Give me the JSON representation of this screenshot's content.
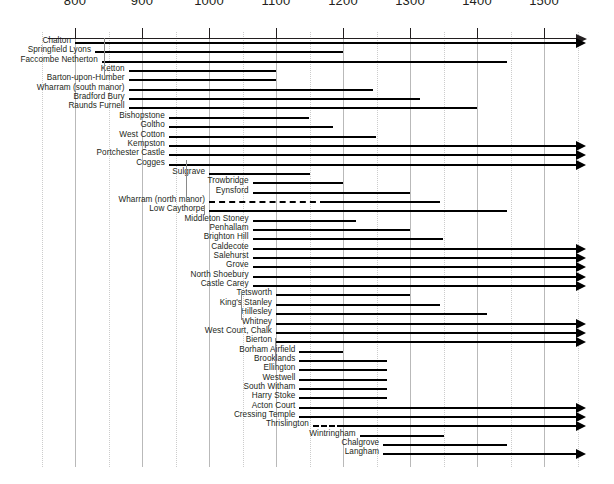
{
  "chart_data": {
    "type": "bar",
    "subtype": "horizontal-range-timeline",
    "title": "",
    "xlabel": "",
    "ylabel": "",
    "xlim": [
      760,
      1560
    ],
    "grid": true,
    "legend": null,
    "x_ticks": [
      800,
      900,
      1000,
      1100,
      1200,
      1300,
      1400,
      1500
    ],
    "x_tick_labels": [
      "800",
      "900",
      "1000",
      "1100",
      "1200",
      "1300",
      "1400",
      "1500"
    ],
    "axis_open_ended": true,
    "note": "Each row is a site; bar spans occupation date range. Arrow head = continues beyond 1500. Dashed segment = uncertain / inferred occupation.",
    "categories": [
      "Chalton",
      "Springfield Lyons",
      "Faccombe Netherton",
      "Ketton",
      "Barton-upon-Humber",
      "Wharram (south manor)",
      "Bradford Bury",
      "Raunds Furnell",
      "Bishopstone",
      "Goltho",
      "West Cotton",
      "Kempston",
      "Portchester Castle",
      "Cogges",
      "Sulgrave",
      "Trowbridge",
      "Eynsford",
      "Wharram (north manor)",
      "Low Caythorpe",
      "Middleton Stoney",
      "Penhallam",
      "Brighton Hill",
      "Caldecote",
      "Salehurst",
      "Grove",
      "North Shoebury",
      "Castle Carey",
      "Tetsworth",
      "King's Stanley",
      "Hillesley",
      "Whitney",
      "West Court, Chalk",
      "Bierton",
      "Borham Airfield",
      "Brooklands",
      "Ellington",
      "Westwell",
      "South Witham",
      "Harry Stoke",
      "Acton Court",
      "Cressing Temple",
      "Thrislington",
      "Wintringham",
      "Chalgrove",
      "Langham"
    ],
    "bars": [
      {
        "label": "Chalton",
        "start": 800,
        "end": 1500,
        "open_end": true,
        "dashed_start": null,
        "dashed_end": null
      },
      {
        "label": "Springfield Lyons",
        "start": 830,
        "end": 1200,
        "open_end": false,
        "dashed_start": null,
        "dashed_end": null
      },
      {
        "label": "Faccombe Netherton",
        "start": 840,
        "end": 1445,
        "open_end": false,
        "dashed_start": null,
        "dashed_end": null
      },
      {
        "label": "Ketton",
        "start": 880,
        "end": 1100,
        "open_end": false,
        "dashed_start": null,
        "dashed_end": null
      },
      {
        "label": "Barton-upon-Humber",
        "start": 880,
        "end": 1100,
        "open_end": false,
        "dashed_start": null,
        "dashed_end": null
      },
      {
        "label": "Wharram (south manor)",
        "start": 880,
        "end": 1245,
        "open_end": false,
        "dashed_start": null,
        "dashed_end": null
      },
      {
        "label": "Bradford Bury",
        "start": 880,
        "end": 1315,
        "open_end": false,
        "dashed_start": null,
        "dashed_end": null
      },
      {
        "label": "Raunds Furnell",
        "start": 880,
        "end": 1400,
        "open_end": false,
        "dashed_start": null,
        "dashed_end": null
      },
      {
        "label": "Bishopstone",
        "start": 940,
        "end": 1150,
        "open_end": false,
        "dashed_start": null,
        "dashed_end": null
      },
      {
        "label": "Goltho",
        "start": 940,
        "end": 1185,
        "open_end": false,
        "dashed_start": null,
        "dashed_end": null
      },
      {
        "label": "West Cotton",
        "start": 940,
        "end": 1250,
        "open_end": false,
        "dashed_start": null,
        "dashed_end": null
      },
      {
        "label": "Kempston",
        "start": 940,
        "end": 1500,
        "open_end": true,
        "dashed_start": null,
        "dashed_end": null
      },
      {
        "label": "Portchester Castle",
        "start": 940,
        "end": 1500,
        "open_end": true,
        "dashed_start": null,
        "dashed_end": null
      },
      {
        "label": "Cogges",
        "start": 940,
        "end": 1500,
        "open_end": true,
        "dashed_start": null,
        "dashed_end": null
      },
      {
        "label": "Sulgrave",
        "start": 1000,
        "end": 1150,
        "open_end": false,
        "dashed_start": null,
        "dashed_end": null
      },
      {
        "label": "Trowbridge",
        "start": 1065,
        "end": 1200,
        "open_end": false,
        "dashed_start": null,
        "dashed_end": null
      },
      {
        "label": "Eynsford",
        "start": 1065,
        "end": 1300,
        "open_end": false,
        "dashed_start": null,
        "dashed_end": null
      },
      {
        "label": "Wharram (north manor)",
        "start": 1000,
        "end": 1345,
        "open_end": false,
        "dashed_start": 1000,
        "dashed_end": 1175
      },
      {
        "label": "Low Caythorpe",
        "start": 1000,
        "end": 1445,
        "open_end": false,
        "dashed_start": null,
        "dashed_end": null
      },
      {
        "label": "Middleton Stoney",
        "start": 1065,
        "end": 1220,
        "open_end": false,
        "dashed_start": null,
        "dashed_end": null
      },
      {
        "label": "Penhallam",
        "start": 1065,
        "end": 1300,
        "open_end": false,
        "dashed_start": null,
        "dashed_end": null
      },
      {
        "label": "Brighton Hill",
        "start": 1065,
        "end": 1350,
        "open_end": false,
        "dashed_start": null,
        "dashed_end": null
      },
      {
        "label": "Caldecote",
        "start": 1065,
        "end": 1500,
        "open_end": true,
        "dashed_start": null,
        "dashed_end": null
      },
      {
        "label": "Salehurst",
        "start": 1065,
        "end": 1500,
        "open_end": true,
        "dashed_start": null,
        "dashed_end": null
      },
      {
        "label": "Grove",
        "start": 1065,
        "end": 1500,
        "open_end": true,
        "dashed_start": null,
        "dashed_end": null
      },
      {
        "label": "North Shoebury",
        "start": 1065,
        "end": 1500,
        "open_end": true,
        "dashed_start": null,
        "dashed_end": null
      },
      {
        "label": "Castle Carey",
        "start": 1065,
        "end": 1500,
        "open_end": true,
        "dashed_start": null,
        "dashed_end": null
      },
      {
        "label": "Tetsworth",
        "start": 1100,
        "end": 1300,
        "open_end": false,
        "dashed_start": null,
        "dashed_end": null
      },
      {
        "label": "King's Stanley",
        "start": 1100,
        "end": 1345,
        "open_end": false,
        "dashed_start": null,
        "dashed_end": null
      },
      {
        "label": "Hillesley",
        "start": 1100,
        "end": 1415,
        "open_end": false,
        "dashed_start": null,
        "dashed_end": null
      },
      {
        "label": "Whitney",
        "start": 1100,
        "end": 1500,
        "open_end": true,
        "dashed_start": null,
        "dashed_end": null
      },
      {
        "label": "West Court, Chalk",
        "start": 1100,
        "end": 1500,
        "open_end": true,
        "dashed_start": null,
        "dashed_end": null
      },
      {
        "label": "Bierton",
        "start": 1100,
        "end": 1500,
        "open_end": true,
        "dashed_start": null,
        "dashed_end": null
      },
      {
        "label": "Borham Airfield",
        "start": 1135,
        "end": 1200,
        "open_end": false,
        "dashed_start": null,
        "dashed_end": null
      },
      {
        "label": "Brooklands",
        "start": 1135,
        "end": 1265,
        "open_end": false,
        "dashed_start": null,
        "dashed_end": null
      },
      {
        "label": "Ellington",
        "start": 1135,
        "end": 1265,
        "open_end": false,
        "dashed_start": null,
        "dashed_end": null
      },
      {
        "label": "Westwell",
        "start": 1135,
        "end": 1265,
        "open_end": false,
        "dashed_start": null,
        "dashed_end": null
      },
      {
        "label": "South Witham",
        "start": 1135,
        "end": 1265,
        "open_end": false,
        "dashed_start": null,
        "dashed_end": null
      },
      {
        "label": "Harry Stoke",
        "start": 1135,
        "end": 1265,
        "open_end": false,
        "dashed_start": null,
        "dashed_end": null
      },
      {
        "label": "Acton Court",
        "start": 1135,
        "end": 1500,
        "open_end": true,
        "dashed_start": null,
        "dashed_end": null
      },
      {
        "label": "Cressing Temple",
        "start": 1135,
        "end": 1500,
        "open_end": true,
        "dashed_start": null,
        "dashed_end": null
      },
      {
        "label": "Thrislington",
        "start": 1155,
        "end": 1500,
        "open_end": true,
        "dashed_start": 1155,
        "dashed_end": 1200
      },
      {
        "label": "Wintringham",
        "start": 1225,
        "end": 1350,
        "open_end": false,
        "dashed_start": null,
        "dashed_end": null
      },
      {
        "label": "Chalgrove",
        "start": 1260,
        "end": 1445,
        "open_end": false,
        "dashed_start": null,
        "dashed_end": null
      },
      {
        "label": "Langham",
        "start": 1260,
        "end": 1500,
        "open_end": true,
        "dashed_start": null,
        "dashed_end": null
      }
    ],
    "colors": {
      "bar": "#000000",
      "axis": "#231f20",
      "gridline": "#b9b9b9",
      "gridline_minor": "#cccccc",
      "text": "#231f20",
      "background": "#ffffff"
    }
  }
}
